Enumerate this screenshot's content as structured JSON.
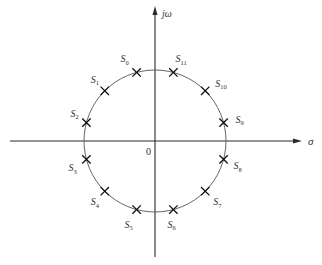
{
  "diagram": {
    "type": "s-plane pole plot",
    "axes": {
      "imaginary_label": "jω",
      "real_label": "σ",
      "origin_label": "0"
    },
    "circle": {
      "center": [
        155,
        141
      ],
      "radius": 71
    },
    "colors": {
      "axis": "#2a2a2a",
      "circle": "#555555",
      "marker": "#111111",
      "text": "#333333"
    },
    "poles": [
      {
        "name": "S",
        "sub": "0",
        "angle_deg": 105,
        "label_dx": -16,
        "label_dy": -10
      },
      {
        "name": "S",
        "sub": "1",
        "angle_deg": 135,
        "label_dx": -14,
        "label_dy": -8
      },
      {
        "name": "S",
        "sub": "2",
        "angle_deg": 165,
        "label_dx": -16,
        "label_dy": -6
      },
      {
        "name": "S",
        "sub": "3",
        "angle_deg": 195,
        "label_dx": -18,
        "label_dy": 12
      },
      {
        "name": "S",
        "sub": "4",
        "angle_deg": 225,
        "label_dx": -14,
        "label_dy": 14
      },
      {
        "name": "S",
        "sub": "5",
        "angle_deg": 255,
        "label_dx": -12,
        "label_dy": 18
      },
      {
        "name": "S",
        "sub": "6",
        "angle_deg": 285,
        "label_dx": -6,
        "label_dy": 18
      },
      {
        "name": "S",
        "sub": "7",
        "angle_deg": 315,
        "label_dx": 8,
        "label_dy": 14
      },
      {
        "name": "S",
        "sub": "8",
        "angle_deg": 345,
        "label_dx": 10,
        "label_dy": 10
      },
      {
        "name": "S",
        "sub": "9",
        "angle_deg": 15,
        "label_dx": 12,
        "label_dy": 0
      },
      {
        "name": "S",
        "sub": "10",
        "angle_deg": 45,
        "label_dx": 10,
        "label_dy": -4
      },
      {
        "name": "S",
        "sub": "11",
        "angle_deg": 75,
        "label_dx": 2,
        "label_dy": -10
      }
    ]
  }
}
